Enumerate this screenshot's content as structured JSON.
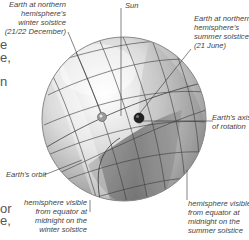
{
  "diagram": {
    "labels": {
      "winter_earth": [
        "Earth at northern",
        "hemisphere's",
        "winter solstice",
        "(21/22 December)"
      ],
      "sun": "Sun",
      "summer_earth": [
        "Earth at northern",
        "hemisphere's",
        "summer solstice",
        "(21 June)"
      ],
      "axis": [
        "Earth's axis",
        "of rotation"
      ],
      "orbit": "Earth's orbit",
      "winter_hemisphere": [
        "hemisphere visible",
        "from equator at",
        "midnight on the",
        "winter solstice"
      ],
      "summer_hemisphere": [
        "hemisphere visible",
        "from equator at",
        "midnight on the",
        "summer solstice"
      ]
    },
    "clipped_text_fragments": [
      "e",
      "e,",
      "n",
      "or",
      "e,"
    ],
    "colors": {
      "sphere_light": "#f2f2f2",
      "sphere_mid": "#b8b8b8",
      "sphere_dark": "#6e6e6e",
      "grid_line": "#3a3a3a",
      "leader_line": "#333333",
      "label_text": "#444444"
    }
  }
}
